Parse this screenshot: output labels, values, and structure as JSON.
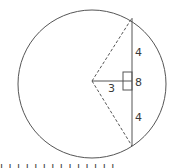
{
  "diagram": {
    "type": "circle-chord-geometry",
    "colors": {
      "stroke": "#555555",
      "background": "#ffffff",
      "text": "#3a3a3a"
    },
    "labels": {
      "upper_half_chord": "4",
      "full_chord": "8",
      "lower_half_chord": "4",
      "center_to_chord_distance": "3"
    },
    "elements": {
      "circle": "circle outline",
      "chord": "vertical chord of length 8",
      "perpendicular": "solid segment from center to chord of length 3",
      "radius_upper": "dashed radius to upper chord endpoint",
      "radius_lower": "dashed radius to lower chord endpoint",
      "right_angle_marker": "square marker at chord midpoint"
    },
    "cut_off_text": "l l l l l l l l l l l l l l"
  }
}
